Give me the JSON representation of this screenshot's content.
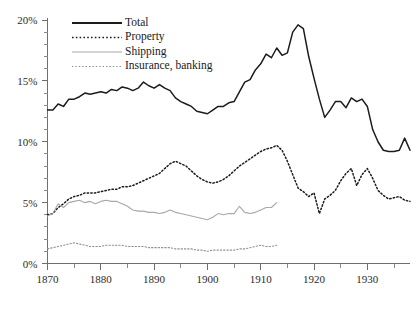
{
  "chart_data": {
    "type": "line",
    "title": "",
    "subtitle": "",
    "xlabel": "",
    "ylabel": "",
    "xlim": [
      1870,
      1938
    ],
    "ylim": [
      0,
      20
    ],
    "grid": false,
    "legend_position": "top-left",
    "y_tick_labels": [
      "0%",
      "5%",
      "10%",
      "15%",
      "20%"
    ],
    "y_tick_values": [
      0,
      5,
      10,
      15,
      20
    ],
    "y_minor_step": 1,
    "x_tick_labels": [
      "1870",
      "1880",
      "1890",
      "1900",
      "1910",
      "1920",
      "1930"
    ],
    "x_tick_values": [
      1870,
      1880,
      1890,
      1900,
      1910,
      1920,
      1930
    ],
    "x_minor_values": [
      1875,
      1885,
      1895,
      1905,
      1915,
      1925,
      1935
    ],
    "series": [
      {
        "name": "Total",
        "style": "solid-black",
        "color": "#1c1c1c",
        "x": [
          1870,
          1871,
          1872,
          1873,
          1874,
          1875,
          1876,
          1877,
          1878,
          1879,
          1880,
          1881,
          1882,
          1883,
          1884,
          1885,
          1886,
          1887,
          1888,
          1889,
          1890,
          1891,
          1892,
          1893,
          1894,
          1895,
          1896,
          1897,
          1898,
          1899,
          1900,
          1901,
          1902,
          1903,
          1904,
          1905,
          1906,
          1907,
          1908,
          1909,
          1910,
          1911,
          1912,
          1913,
          1914,
          1915,
          1916,
          1917,
          1918,
          1919,
          1920,
          1921,
          1922,
          1923,
          1924,
          1925,
          1926,
          1927,
          1928,
          1929,
          1930,
          1931,
          1932,
          1933,
          1934,
          1935,
          1936,
          1937,
          1938
        ],
        "values": [
          12.6,
          12.6,
          13.1,
          12.9,
          13.5,
          13.5,
          13.7,
          14.0,
          13.9,
          14.0,
          14.1,
          14.0,
          14.3,
          14.2,
          14.5,
          14.4,
          14.2,
          14.4,
          14.9,
          14.6,
          14.4,
          14.7,
          14.4,
          14.2,
          13.6,
          13.3,
          13.1,
          12.9,
          12.5,
          12.4,
          12.3,
          12.6,
          12.9,
          12.9,
          13.2,
          13.3,
          14.1,
          14.9,
          15.1,
          15.9,
          16.4,
          17.2,
          16.9,
          17.7,
          17.1,
          17.3,
          19.0,
          19.6,
          19.3,
          17.0,
          15.2,
          13.5,
          12.0,
          12.6,
          13.3,
          13.3,
          12.8,
          13.6,
          13.3,
          13.5,
          12.9,
          11.0,
          10.0,
          9.3,
          9.2,
          9.2,
          9.3,
          10.3,
          9.3
        ]
      },
      {
        "name": "Property",
        "style": "dotted-black",
        "color": "#1c1c1c",
        "x": [
          1870,
          1871,
          1872,
          1873,
          1874,
          1875,
          1876,
          1877,
          1878,
          1879,
          1880,
          1881,
          1882,
          1883,
          1884,
          1885,
          1886,
          1887,
          1888,
          1889,
          1890,
          1891,
          1892,
          1893,
          1894,
          1895,
          1896,
          1897,
          1898,
          1899,
          1900,
          1901,
          1902,
          1903,
          1904,
          1905,
          1906,
          1907,
          1908,
          1909,
          1910,
          1911,
          1912,
          1913,
          1914,
          1915,
          1916,
          1917,
          1918,
          1919,
          1920,
          1921,
          1922,
          1923,
          1924,
          1925,
          1926,
          1927,
          1928,
          1929,
          1930,
          1931,
          1932,
          1933,
          1934,
          1935,
          1936,
          1937,
          1938
        ],
        "values": [
          4.0,
          4.1,
          4.6,
          4.9,
          5.3,
          5.5,
          5.6,
          5.8,
          5.8,
          5.8,
          5.9,
          6.0,
          6.1,
          6.1,
          6.3,
          6.3,
          6.4,
          6.6,
          6.8,
          7.0,
          7.2,
          7.4,
          7.8,
          8.2,
          8.4,
          8.2,
          8.0,
          7.6,
          7.2,
          6.9,
          6.7,
          6.6,
          6.7,
          6.9,
          7.2,
          7.6,
          8.0,
          8.3,
          8.6,
          8.9,
          9.2,
          9.4,
          9.5,
          9.7,
          9.3,
          8.4,
          7.3,
          6.2,
          5.9,
          5.5,
          5.8,
          4.1,
          5.3,
          5.6,
          6.0,
          6.8,
          7.4,
          7.8,
          6.4,
          7.3,
          7.8,
          7.0,
          6.0,
          5.6,
          5.3,
          5.4,
          5.5,
          5.2,
          5.1
        ]
      },
      {
        "name": "Shipping",
        "style": "solid-gray",
        "color": "#a8a8a8",
        "x": [
          1870,
          1871,
          1872,
          1873,
          1874,
          1875,
          1876,
          1877,
          1878,
          1879,
          1880,
          1881,
          1882,
          1883,
          1884,
          1885,
          1886,
          1887,
          1888,
          1889,
          1890,
          1891,
          1892,
          1893,
          1894,
          1895,
          1896,
          1897,
          1898,
          1899,
          1900,
          1901,
          1902,
          1903,
          1904,
          1905,
          1906,
          1907,
          1908,
          1909,
          1910,
          1911,
          1912,
          1913
        ],
        "values": [
          3.9,
          4.1,
          4.9,
          4.6,
          5.0,
          5.1,
          5.2,
          5.0,
          5.1,
          4.9,
          5.1,
          5.2,
          5.1,
          5.1,
          4.9,
          4.7,
          4.4,
          4.3,
          4.3,
          4.2,
          4.2,
          4.1,
          4.2,
          4.4,
          4.2,
          4.1,
          4.0,
          3.9,
          3.8,
          3.7,
          3.6,
          3.8,
          4.1,
          4.0,
          4.1,
          4.1,
          4.7,
          4.2,
          4.1,
          4.2,
          4.4,
          4.6,
          4.6,
          5.0
        ]
      },
      {
        "name": "Insurance, banking",
        "style": "dotted-gray",
        "color": "#8f8f8f",
        "x": [
          1870,
          1871,
          1872,
          1873,
          1874,
          1875,
          1876,
          1877,
          1878,
          1879,
          1880,
          1881,
          1882,
          1883,
          1884,
          1885,
          1886,
          1887,
          1888,
          1889,
          1890,
          1891,
          1892,
          1893,
          1894,
          1895,
          1896,
          1897,
          1898,
          1899,
          1900,
          1901,
          1902,
          1903,
          1904,
          1905,
          1906,
          1907,
          1908,
          1909,
          1910,
          1911,
          1912,
          1913
        ],
        "values": [
          1.2,
          1.3,
          1.4,
          1.5,
          1.6,
          1.7,
          1.6,
          1.5,
          1.4,
          1.4,
          1.4,
          1.5,
          1.5,
          1.5,
          1.5,
          1.4,
          1.4,
          1.4,
          1.4,
          1.3,
          1.3,
          1.3,
          1.3,
          1.3,
          1.2,
          1.2,
          1.2,
          1.2,
          1.1,
          1.1,
          1.0,
          1.1,
          1.1,
          1.1,
          1.1,
          1.1,
          1.2,
          1.2,
          1.3,
          1.4,
          1.5,
          1.4,
          1.4,
          1.5
        ]
      }
    ],
    "legend": [
      {
        "label": "Total",
        "style": "solid-black"
      },
      {
        "label": "Property",
        "style": "dotted-black"
      },
      {
        "label": "Shipping",
        "style": "solid-gray"
      },
      {
        "label": "Insurance, banking",
        "style": "dotted-gray"
      }
    ]
  }
}
